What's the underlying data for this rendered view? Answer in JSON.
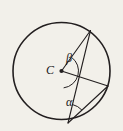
{
  "figure": {
    "kind": "circle-geometry-diagram",
    "background_color": "#f2f0ea",
    "stroke_color": "#231f20",
    "width": 123,
    "height": 131,
    "circle": {
      "center_label": "C",
      "center_x": 61.5,
      "center_y": 71,
      "radius": 48.5,
      "stroke_width": 1.5
    },
    "center_dot": {
      "x": 61.5,
      "y": 71,
      "radius": 2.1
    },
    "points": [
      {
        "id": "A",
        "x": 90.5,
        "y": 30.5,
        "on": "circle",
        "role": "upper-right point"
      },
      {
        "id": "B",
        "x": 108.0,
        "y": 86.0,
        "on": "circle",
        "role": "right point"
      },
      {
        "id": "D",
        "x": 68.0,
        "y": 123.0,
        "on": "circle",
        "role": "bottom point"
      }
    ],
    "segments": [
      {
        "id": "radius-CA",
        "from": "C",
        "to": "A",
        "type": "radius"
      },
      {
        "id": "radius-CB",
        "from": "C",
        "to": "B",
        "type": "radius"
      },
      {
        "id": "chord-AD",
        "from": "A",
        "to": "D",
        "type": "chord"
      },
      {
        "id": "chord-DB",
        "from": "D",
        "to": "B",
        "type": "chord"
      }
    ],
    "angles": [
      {
        "id": "beta",
        "label": "β",
        "vertex": "C",
        "between": [
          "radius-CA",
          "chord-AD"
        ],
        "type": "central-angle",
        "arc_radius": 17
      },
      {
        "id": "alpha",
        "label": "α",
        "vertex": "D",
        "between": [
          "chord-AD",
          "chord-DB"
        ],
        "type": "inscribed-angle",
        "arc_radius": 19
      }
    ]
  }
}
